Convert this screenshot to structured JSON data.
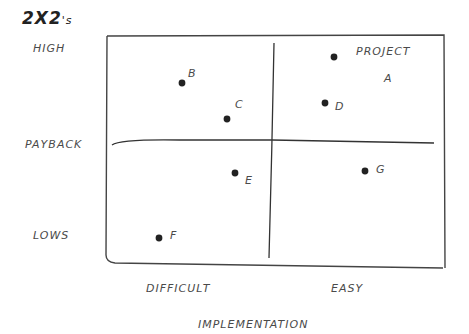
{
  "title": {
    "main": "2X2",
    "suffix": "'s"
  },
  "y_axis": {
    "label": "PAYBACK",
    "high": "HIGH",
    "low": "LOWS"
  },
  "x_axis": {
    "label": "IMPLEMENTATION",
    "left": "DIFFICULT",
    "right": "EASY"
  },
  "points": [
    {
      "id": "A",
      "label": "PROJECT",
      "label2": "A",
      "x": 334,
      "y": 57
    },
    {
      "id": "B",
      "label": "B",
      "x": 182,
      "y": 83
    },
    {
      "id": "C",
      "label": "C",
      "x": 227,
      "y": 119
    },
    {
      "id": "D",
      "label": "D",
      "x": 325,
      "y": 103
    },
    {
      "id": "E",
      "label": "E",
      "x": 235,
      "y": 173
    },
    {
      "id": "F",
      "label": "F",
      "x": 159,
      "y": 238
    },
    {
      "id": "G",
      "label": "G",
      "x": 365,
      "y": 171
    }
  ]
}
